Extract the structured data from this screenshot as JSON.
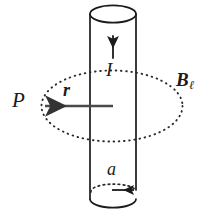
{
  "figure": {
    "type": "physics-diagram",
    "background_color": "#ffffff",
    "stroke_color": "#1b1b1b",
    "labels": {
      "point_P": "P",
      "radius_r": "r",
      "current_I": "I",
      "cylinder_radius_a": "a",
      "field_B": "B",
      "field_B_subscript": "ℓ"
    },
    "elements": {
      "cylinder": {
        "name": "cylindrical-conductor",
        "left_x": 90,
        "right_x": 136,
        "top_y": 14,
        "bottom_y": 199,
        "ellipse_ry": 9
      },
      "current_arrow": {
        "name": "current-direction-arrow",
        "direction": "up",
        "x": 113,
        "y_start": 58,
        "y_end": 34
      },
      "field_loop": {
        "name": "magnetic-field-circle",
        "style": "dotted",
        "center_x": 112,
        "center_y": 106,
        "rx": 71,
        "ry": 36
      },
      "radius_arrow": {
        "name": "radius-r-arrow",
        "direction": "left",
        "x_start": 113,
        "x_end": 42,
        "y": 106
      },
      "cylinder_radius_arrow": {
        "name": "radius-a-arrow",
        "direction": "right",
        "x_start": 113,
        "x_end": 137,
        "y": 190
      }
    }
  }
}
